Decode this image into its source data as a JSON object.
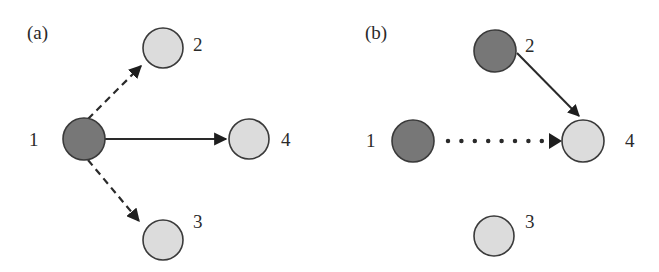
{
  "colors": {
    "dark_node": "#777777",
    "light_node": "#dcdcdc",
    "stroke": "#3a3a3a",
    "edge": "#2a2a2a"
  },
  "panels": [
    {
      "id": "a",
      "label": "(a)",
      "nodes": [
        {
          "id": "1",
          "label": "1",
          "state": "dark"
        },
        {
          "id": "2",
          "label": "2",
          "state": "light"
        },
        {
          "id": "3",
          "label": "3",
          "state": "light"
        },
        {
          "id": "4",
          "label": "4",
          "state": "light"
        }
      ],
      "edges": [
        {
          "from": "1",
          "to": "2",
          "style": "dashed"
        },
        {
          "from": "1",
          "to": "3",
          "style": "dashed"
        },
        {
          "from": "1",
          "to": "4",
          "style": "solid"
        }
      ]
    },
    {
      "id": "b",
      "label": "(b)",
      "nodes": [
        {
          "id": "1",
          "label": "1",
          "state": "dark"
        },
        {
          "id": "2",
          "label": "2",
          "state": "dark"
        },
        {
          "id": "3",
          "label": "3",
          "state": "light"
        },
        {
          "id": "4",
          "label": "4",
          "state": "light"
        }
      ],
      "edges": [
        {
          "from": "2",
          "to": "4",
          "style": "solid"
        },
        {
          "from": "1",
          "to": "4",
          "style": "dotted"
        }
      ]
    }
  ]
}
